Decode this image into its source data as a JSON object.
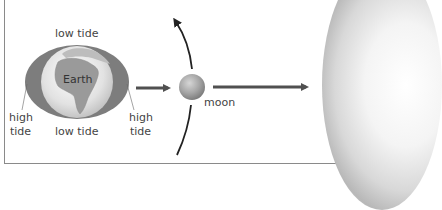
{
  "diagram": {
    "earth_label": "Earth",
    "moon_label": "moon",
    "labels": {
      "low_tide_top": "low tide",
      "low_tide_bottom": "low tide",
      "high_tide_left_1": "high",
      "high_tide_left_2": "tide",
      "high_tide_right_1": "high",
      "high_tide_right_2": "tide"
    },
    "colors": {
      "tide_bulge": "#7d7d7d",
      "earth_land": "#9a9a9a",
      "earth_ocean": "#e6e6e6",
      "moon": "#a8a8a8",
      "arrow": "#505050",
      "orbit": "#222222"
    }
  }
}
